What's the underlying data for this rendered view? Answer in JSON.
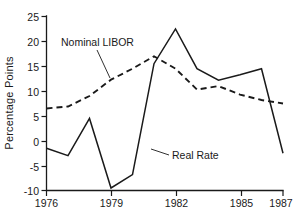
{
  "chart_data": {
    "type": "line",
    "title": "",
    "xlabel": "",
    "ylabel": "Percentage Points",
    "xlim": [
      1976,
      1987
    ],
    "ylim": [
      -10,
      25
    ],
    "grid": false,
    "legend_position": "inline-annotations",
    "x": [
      1976,
      1977,
      1978,
      1979,
      1980,
      1981,
      1982,
      1983,
      1984,
      1985,
      1986,
      1987
    ],
    "xticks": [
      1976,
      1979,
      1982,
      1985,
      1987
    ],
    "xtick_labels": [
      "1976",
      "1979",
      "1982",
      "1985",
      "1987"
    ],
    "yticks": [
      -10,
      -5,
      0,
      5,
      10,
      15,
      20,
      25
    ],
    "ytick_labels": [
      "-10",
      "-5",
      "0",
      "5",
      "10",
      "15",
      "20",
      "25"
    ],
    "series": [
      {
        "name": "Nominal LIBOR",
        "style": "dashed",
        "values": [
          6.5,
          6.9,
          9.0,
          12.3,
          14.5,
          17.0,
          14.5,
          10.3,
          11.0,
          9.3,
          8.2,
          7.5
        ]
      },
      {
        "name": "Real Rate",
        "style": "solid",
        "values": [
          -1.5,
          -3.0,
          4.5,
          -9.5,
          -6.8,
          15.5,
          22.5,
          14.5,
          12.2,
          13.3,
          14.5,
          -2.5
        ]
      }
    ],
    "annotations": [
      {
        "text": "Nominal LIBOR",
        "series": "Nominal LIBOR"
      },
      {
        "text": "Real Rate",
        "series": "Real Rate"
      }
    ],
    "colors": {
      "line": "#1a1a1a",
      "background": "#ffffff"
    }
  }
}
